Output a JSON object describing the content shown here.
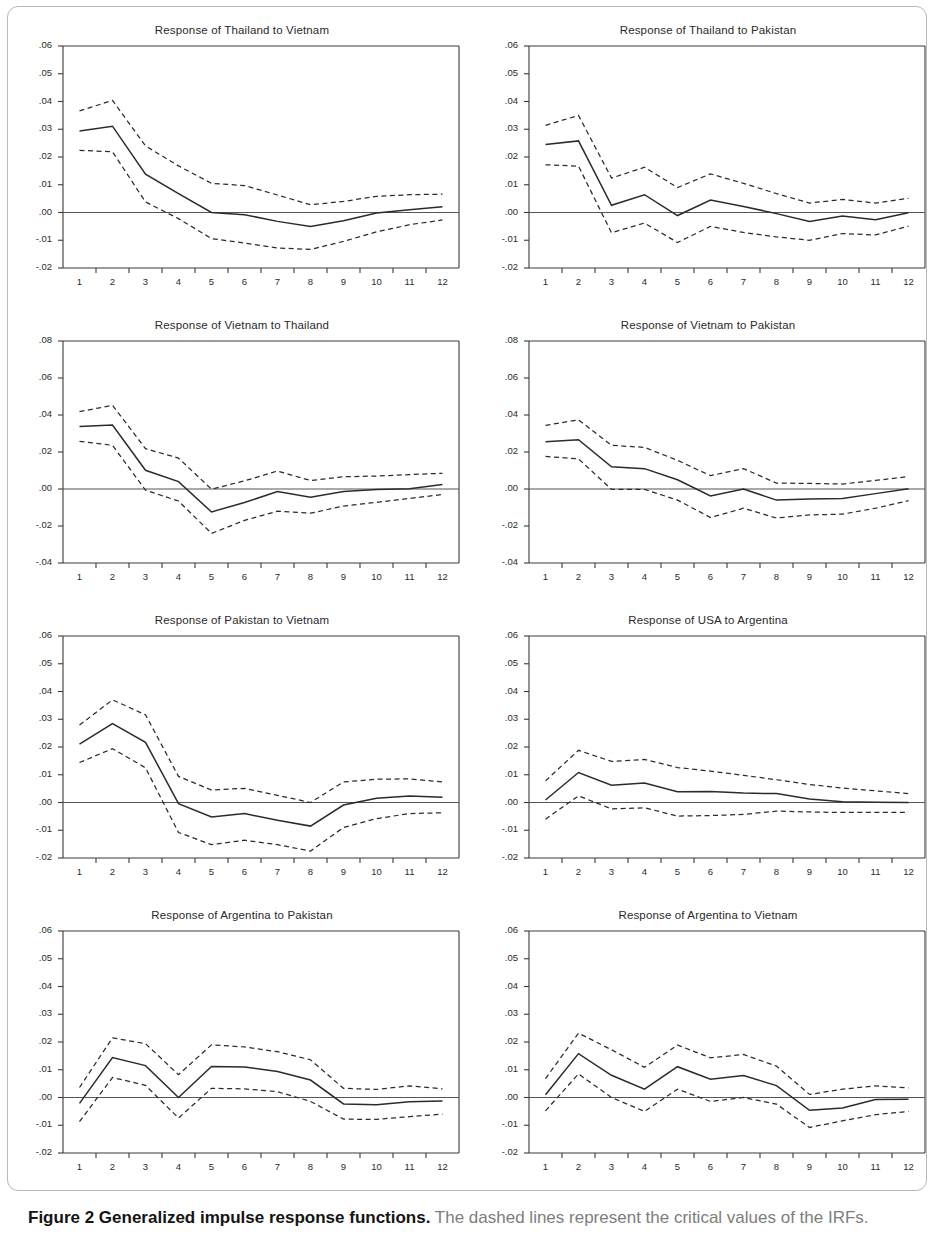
{
  "figure": {
    "caption_bold": "Figure 2 Generalized impulse response functions.",
    "caption_rest": " The dashed lines represent the critical values of the IRFs."
  },
  "axis": {
    "x_ticks": [
      "1",
      "2",
      "3",
      "4",
      "5",
      "6",
      "7",
      "8",
      "9",
      "10",
      "11",
      "12"
    ],
    "y_ticks_a": [
      ".06",
      ".05",
      ".04",
      ".03",
      ".02",
      ".01",
      ".00",
      "-.01",
      "-.02"
    ],
    "y_ticks_b": [
      ".08",
      ".06",
      ".04",
      ".02",
      ".00",
      "-.02",
      "-.04"
    ]
  },
  "colors": {
    "line": "#2b2b2b",
    "axis": "#3a3a3a",
    "zero": "#555555",
    "border": "#b9b9b9"
  },
  "chart_data": [
    {
      "type": "line",
      "title": "Response of Thailand to Vietnam",
      "xlabel": "",
      "ylabel": "",
      "x": [
        1,
        2,
        3,
        4,
        5,
        6,
        7,
        8,
        9,
        10,
        11,
        12
      ],
      "ylim": [
        -0.02,
        0.06
      ],
      "yticks": [
        0.06,
        0.05,
        0.04,
        0.03,
        0.02,
        0.01,
        0.0,
        -0.01,
        -0.02
      ],
      "grid": false,
      "series": [
        {
          "name": "upper critical value",
          "style": "dashed",
          "values": [
            0.0366,
            0.0404,
            0.024,
            0.0168,
            0.0105,
            0.0097,
            0.0063,
            0.0028,
            0.004,
            0.0058,
            0.0064,
            0.0066
          ]
        },
        {
          "name": "impulse response",
          "style": "solid",
          "values": [
            0.0294,
            0.0311,
            0.0138,
            0.0068,
            0.0,
            -0.0008,
            -0.0032,
            -0.005,
            -0.003,
            -0.0002,
            0.001,
            0.0021
          ]
        },
        {
          "name": "lower critical value",
          "style": "dashed",
          "values": [
            0.0224,
            0.0219,
            0.0038,
            -0.0022,
            -0.0094,
            -0.011,
            -0.0128,
            -0.0133,
            -0.0104,
            -0.007,
            -0.0044,
            -0.0027
          ]
        }
      ]
    },
    {
      "type": "line",
      "title": "Response of Thailand to Pakistan",
      "xlabel": "",
      "ylabel": "",
      "x": [
        1,
        2,
        3,
        4,
        5,
        6,
        7,
        8,
        9,
        10,
        11,
        12
      ],
      "ylim": [
        -0.02,
        0.06
      ],
      "yticks": [
        0.06,
        0.05,
        0.04,
        0.03,
        0.02,
        0.01,
        0.0,
        -0.01,
        -0.02
      ],
      "grid": false,
      "series": [
        {
          "name": "upper critical value",
          "style": "dashed",
          "values": [
            0.0314,
            0.035,
            0.0124,
            0.0163,
            0.009,
            0.0139,
            0.0105,
            0.0068,
            0.0034,
            0.0047,
            0.0034,
            0.0051
          ]
        },
        {
          "name": "impulse response",
          "style": "solid",
          "values": [
            0.0245,
            0.0258,
            0.0026,
            0.0064,
            -0.0011,
            0.0045,
            0.0022,
            -0.0004,
            -0.0032,
            -0.0013,
            -0.0026,
            -0.0001
          ]
        },
        {
          "name": "lower critical value",
          "style": "dashed",
          "values": [
            0.0172,
            0.0167,
            -0.0073,
            -0.0038,
            -0.0108,
            -0.005,
            -0.0072,
            -0.0088,
            -0.01,
            -0.0076,
            -0.0081,
            -0.0049
          ]
        }
      ]
    },
    {
      "type": "line",
      "title": "Response of Vietnam to Thailand",
      "xlabel": "",
      "ylabel": "",
      "x": [
        1,
        2,
        3,
        4,
        5,
        6,
        7,
        8,
        9,
        10,
        11,
        12
      ],
      "ylim": [
        -0.04,
        0.08
      ],
      "yticks": [
        0.08,
        0.06,
        0.04,
        0.02,
        0.0,
        -0.02,
        -0.04
      ],
      "grid": false,
      "series": [
        {
          "name": "upper critical value",
          "style": "dashed",
          "values": [
            0.0418,
            0.0452,
            0.0218,
            0.0167,
            -0.0001,
            0.0044,
            0.0097,
            0.0046,
            0.0066,
            0.007,
            0.0078,
            0.0085
          ]
        },
        {
          "name": "impulse response",
          "style": "solid",
          "values": [
            0.0338,
            0.0346,
            0.0101,
            0.004,
            -0.0124,
            -0.0073,
            -0.0014,
            -0.0045,
            -0.0013,
            -0.0003,
            0.0002,
            0.0024
          ]
        },
        {
          "name": "lower critical value",
          "style": "dashed",
          "values": [
            0.0258,
            0.0236,
            -0.0006,
            -0.0065,
            -0.024,
            -0.017,
            -0.012,
            -0.0131,
            -0.0092,
            -0.0072,
            -0.0051,
            -0.003
          ]
        }
      ]
    },
    {
      "type": "line",
      "title": "Response of Vietnam to Pakistan",
      "xlabel": "",
      "ylabel": "",
      "x": [
        1,
        2,
        3,
        4,
        5,
        6,
        7,
        8,
        9,
        10,
        11,
        12
      ],
      "ylim": [
        -0.04,
        0.08
      ],
      "yticks": [
        0.08,
        0.06,
        0.04,
        0.02,
        0.0,
        -0.02,
        -0.04
      ],
      "grid": false,
      "series": [
        {
          "name": "upper critical value",
          "style": "dashed",
          "values": [
            0.0344,
            0.0374,
            0.0236,
            0.0225,
            0.0155,
            0.0072,
            0.011,
            0.0032,
            0.003,
            0.0027,
            0.0046,
            0.0067
          ]
        },
        {
          "name": "impulse response",
          "style": "solid",
          "values": [
            0.0256,
            0.0266,
            0.012,
            0.011,
            0.005,
            -0.0038,
            0.0,
            -0.006,
            -0.0054,
            -0.0051,
            -0.0025,
            0.0001
          ]
        },
        {
          "name": "lower critical value",
          "style": "dashed",
          "values": [
            0.0176,
            0.0163,
            -0.0002,
            -0.0002,
            -0.006,
            -0.0154,
            -0.0104,
            -0.0157,
            -0.014,
            -0.0136,
            -0.0104,
            -0.0063
          ]
        }
      ]
    },
    {
      "type": "line",
      "title": "Response of Pakistan to Vietnam",
      "xlabel": "",
      "ylabel": "",
      "x": [
        1,
        2,
        3,
        4,
        5,
        6,
        7,
        8,
        9,
        10,
        11,
        12
      ],
      "ylim": [
        -0.02,
        0.06
      ],
      "yticks": [
        0.06,
        0.05,
        0.04,
        0.03,
        0.02,
        0.01,
        0.0,
        -0.01,
        -0.02
      ],
      "grid": false,
      "series": [
        {
          "name": "upper critical value",
          "style": "dashed",
          "values": [
            0.0279,
            0.037,
            0.0316,
            0.0094,
            0.0045,
            0.0051,
            0.0026,
            0.0,
            0.0074,
            0.0084,
            0.0085,
            0.0074
          ]
        },
        {
          "name": "impulse response",
          "style": "solid",
          "values": [
            0.021,
            0.0284,
            0.0217,
            -0.0004,
            -0.0052,
            -0.004,
            -0.0064,
            -0.0085,
            -0.0009,
            0.0015,
            0.0023,
            0.0019
          ]
        },
        {
          "name": "lower critical value",
          "style": "dashed",
          "values": [
            0.0144,
            0.0194,
            0.0125,
            -0.0108,
            -0.0152,
            -0.0136,
            -0.0152,
            -0.0175,
            -0.009,
            -0.0058,
            -0.004,
            -0.0037
          ]
        }
      ]
    },
    {
      "type": "line",
      "title": "Response of USA to Argentina",
      "xlabel": "",
      "ylabel": "",
      "x": [
        1,
        2,
        3,
        4,
        5,
        6,
        7,
        8,
        9,
        10,
        11,
        12
      ],
      "ylim": [
        -0.02,
        0.06
      ],
      "yticks": [
        0.06,
        0.05,
        0.04,
        0.03,
        0.02,
        0.01,
        0.0,
        -0.01,
        -0.02
      ],
      "grid": false,
      "series": [
        {
          "name": "upper critical value",
          "style": "dashed",
          "values": [
            0.0078,
            0.0188,
            0.0148,
            0.0155,
            0.0126,
            0.0113,
            0.0098,
            0.0082,
            0.0065,
            0.0052,
            0.0042,
            0.0032
          ]
        },
        {
          "name": "impulse response",
          "style": "solid",
          "values": [
            0.0009,
            0.0108,
            0.0062,
            0.007,
            0.0039,
            0.004,
            0.0034,
            0.0032,
            0.0013,
            0.0003,
            0.0001,
            0.0
          ]
        },
        {
          "name": "lower critical value",
          "style": "dashed",
          "values": [
            -0.006,
            0.0024,
            -0.0023,
            -0.0019,
            -0.0049,
            -0.0047,
            -0.0043,
            -0.0031,
            -0.0034,
            -0.0036,
            -0.0036,
            -0.0036
          ]
        }
      ]
    },
    {
      "type": "line",
      "title": "Response of Argentina to Pakistan",
      "xlabel": "",
      "ylabel": "",
      "x": [
        1,
        2,
        3,
        4,
        5,
        6,
        7,
        8,
        9,
        10,
        11,
        12
      ],
      "ylim": [
        -0.02,
        0.06
      ],
      "yticks": [
        0.06,
        0.05,
        0.04,
        0.03,
        0.02,
        0.01,
        0.0,
        -0.01,
        -0.02
      ],
      "grid": false,
      "series": [
        {
          "name": "upper critical value",
          "style": "dashed",
          "values": [
            0.0036,
            0.0215,
            0.0194,
            0.0082,
            0.019,
            0.0182,
            0.0165,
            0.0136,
            0.0033,
            0.0029,
            0.0042,
            0.0031
          ]
        },
        {
          "name": "impulse response",
          "style": "solid",
          "values": [
            -0.0021,
            0.0144,
            0.0115,
            0.0,
            0.0112,
            0.011,
            0.0094,
            0.0063,
            -0.0023,
            -0.0026,
            -0.0015,
            -0.0013
          ]
        },
        {
          "name": "lower critical value",
          "style": "dashed",
          "values": [
            -0.0087,
            0.0072,
            0.0044,
            -0.0074,
            0.0033,
            0.0031,
            0.0021,
            -0.0014,
            -0.0078,
            -0.0079,
            -0.0069,
            -0.006
          ]
        }
      ]
    },
    {
      "type": "line",
      "title": "Response of Argentina to Vietnam",
      "xlabel": "",
      "ylabel": "",
      "x": [
        1,
        2,
        3,
        4,
        5,
        6,
        7,
        8,
        9,
        10,
        11,
        12
      ],
      "ylim": [
        -0.02,
        0.06
      ],
      "yticks": [
        0.06,
        0.05,
        0.04,
        0.03,
        0.02,
        0.01,
        0.0,
        -0.01,
        -0.02
      ],
      "grid": false,
      "series": [
        {
          "name": "upper critical value",
          "style": "dashed",
          "values": [
            0.0068,
            0.0232,
            0.0172,
            0.0109,
            0.0189,
            0.0143,
            0.0155,
            0.0113,
            0.0011,
            0.003,
            0.0042,
            0.0035
          ]
        },
        {
          "name": "impulse response",
          "style": "solid",
          "values": [
            0.001,
            0.0158,
            0.008,
            0.003,
            0.0111,
            0.0066,
            0.0079,
            0.0043,
            -0.0046,
            -0.0038,
            -0.0007,
            -0.0006
          ]
        },
        {
          "name": "lower critical value",
          "style": "dashed",
          "values": [
            -0.0048,
            0.0085,
            0.0,
            -0.005,
            0.003,
            -0.0014,
            0.0,
            -0.0024,
            -0.0108,
            -0.0084,
            -0.0062,
            -0.005
          ]
        }
      ]
    }
  ]
}
